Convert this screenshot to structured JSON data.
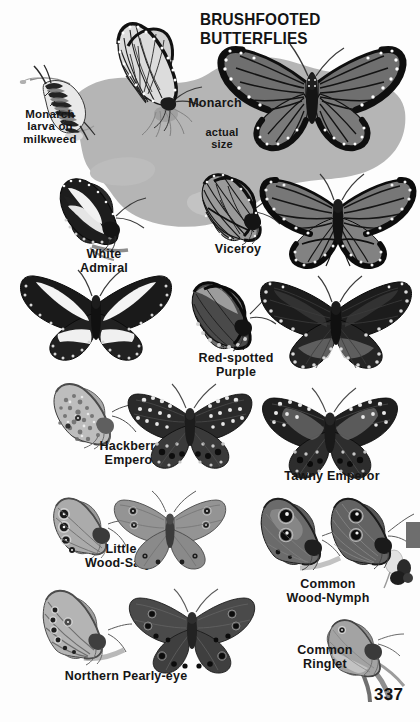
{
  "page": {
    "title": "BRUSHFOOTED BUTTERFLIES",
    "number": "337",
    "background_color": "#fdfdfd",
    "blob_color": "#b5b5b5",
    "tab_color": "#6e6e6e",
    "text_color": "#151515"
  },
  "labels": {
    "monarch_larva": "Monarch\nlarva on\nmilkweed",
    "monarch": "Monarch",
    "actual_size": "actual\nsize",
    "white_admiral": "White\nAdmiral",
    "viceroy": "Viceroy",
    "red_spotted_purple": "Red-spotted\nPurple",
    "hackberry_emperor": "Hackberry\nEmperor",
    "tawny_emperor": "Tawny Emperor",
    "little_wood_satyr": "Little\nWood-Satyr",
    "common_wood_nymph": "Common\nWood-Nymph",
    "northern_pearly_eye": "Northern Pearly-eye",
    "common_ringlet": "Common\nRinglet"
  },
  "species": [
    {
      "name": "Monarch larva on milkweed",
      "label_key": "monarch_larva",
      "specimens": [
        {
          "id": "monarch-caterpillar",
          "view": "larva on milkweed stem"
        }
      ]
    },
    {
      "name": "Monarch",
      "label_key": "monarch",
      "note": "actual size",
      "specimens": [
        {
          "id": "monarch-underside",
          "view": "side view wings closed, nectaring"
        },
        {
          "id": "monarch-upperside",
          "view": "spread wings, dorsal"
        }
      ]
    },
    {
      "name": "White Admiral",
      "label_key": "white_admiral",
      "specimens": [
        {
          "id": "white-admiral-side",
          "view": "side view perched"
        },
        {
          "id": "white-admiral-spread",
          "view": "spread wings, dorsal"
        }
      ]
    },
    {
      "name": "Viceroy",
      "label_key": "viceroy",
      "specimens": [
        {
          "id": "viceroy-side",
          "view": "side view wings closed"
        },
        {
          "id": "viceroy-spread",
          "view": "spread wings, dorsal"
        }
      ]
    },
    {
      "name": "Red-spotted Purple",
      "label_key": "red_spotted_purple",
      "specimens": [
        {
          "id": "red-spotted-purple-side",
          "view": "side view wings closed"
        },
        {
          "id": "red-spotted-purple-spread",
          "view": "spread wings, dorsal"
        }
      ]
    },
    {
      "name": "Hackberry Emperor",
      "label_key": "hackberry_emperor",
      "specimens": [
        {
          "id": "hackberry-emperor-side",
          "view": "side view wings closed"
        },
        {
          "id": "hackberry-emperor-spread",
          "view": "spread wings, dorsal"
        }
      ]
    },
    {
      "name": "Tawny Emperor",
      "label_key": "tawny_emperor",
      "specimens": [
        {
          "id": "tawny-emperor-spread",
          "view": "spread wings, dorsal"
        }
      ]
    },
    {
      "name": "Little Wood-Satyr",
      "label_key": "little_wood_satyr",
      "specimens": [
        {
          "id": "little-wood-satyr-side",
          "view": "side view wings closed, eyespots"
        },
        {
          "id": "little-wood-satyr-spread",
          "view": "spread wings, dorsal"
        }
      ]
    },
    {
      "name": "Common Wood-Nymph",
      "label_key": "common_wood_nymph",
      "specimens": [
        {
          "id": "common-wood-nymph-a",
          "view": "side view wings closed, two eyespots"
        },
        {
          "id": "common-wood-nymph-b",
          "view": "side view wings closed, on flower"
        }
      ]
    },
    {
      "name": "Northern Pearly-eye",
      "label_key": "northern_pearly_eye",
      "specimens": [
        {
          "id": "northern-pearly-eye-side",
          "view": "side view wings closed"
        },
        {
          "id": "northern-pearly-eye-spread",
          "view": "spread wings, dorsal"
        }
      ]
    },
    {
      "name": "Common Ringlet",
      "label_key": "common_ringlet",
      "specimens": [
        {
          "id": "common-ringlet-side",
          "view": "side view wings closed on grass"
        }
      ]
    }
  ]
}
